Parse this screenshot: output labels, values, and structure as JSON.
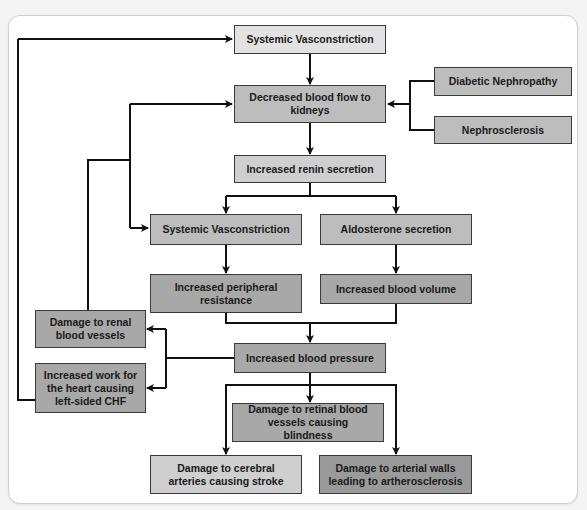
{
  "diagram": {
    "colors": {
      "panel_bg": "#ffffff",
      "box_light": "#e2e2e2",
      "box_mid": "#bdbdbd",
      "box_dark": "#a8a8a8",
      "arrow": "#111111"
    },
    "nodes": {
      "systemic_vasoconstriction_top": "Systemic Vasconstriction",
      "decreased_blood_flow": "Decreased blood flow to kidneys",
      "diabetic_nephropathy": "Diabetic Nephropathy",
      "nephrosclerosis": "Nephrosclerosis",
      "increased_renin": "Increased renin secretion",
      "systemic_vasoconstriction_mid": "Systemic Vasconstriction",
      "aldosterone": "Aldosterone secretion",
      "peripheral_resistance": "Increased peripheral resistance",
      "blood_volume": "Increased blood volume",
      "renal_vessel_damage": "Damage to renal blood vessels",
      "heart_work_chf": "Increased work for the heart causing left-sided CHF",
      "blood_pressure": "Increased blood pressure",
      "retinal_damage": "Damage to retinal blood vessels causing blindness",
      "cerebral_damage": "Damage to cerebral arteries causing stroke",
      "arterial_damage": "Damage to arterial walls leading to artherosclerosis"
    },
    "edges": [
      [
        "systemic_vasoconstriction_top",
        "decreased_blood_flow"
      ],
      [
        "diabetic_nephropathy",
        "decreased_blood_flow"
      ],
      [
        "nephrosclerosis",
        "decreased_blood_flow"
      ],
      [
        "decreased_blood_flow",
        "increased_renin"
      ],
      [
        "increased_renin",
        "systemic_vasoconstriction_mid"
      ],
      [
        "increased_renin",
        "aldosterone"
      ],
      [
        "systemic_vasoconstriction_mid",
        "peripheral_resistance"
      ],
      [
        "aldosterone",
        "blood_volume"
      ],
      [
        "peripheral_resistance",
        "blood_pressure"
      ],
      [
        "blood_volume",
        "blood_pressure"
      ],
      [
        "blood_pressure",
        "renal_vessel_damage"
      ],
      [
        "blood_pressure",
        "heart_work_chf"
      ],
      [
        "blood_pressure",
        "retinal_damage"
      ],
      [
        "blood_pressure",
        "cerebral_damage"
      ],
      [
        "blood_pressure",
        "arterial_damage"
      ],
      [
        "renal_vessel_damage",
        "decreased_blood_flow"
      ],
      [
        "renal_vessel_damage",
        "systemic_vasoconstriction_mid"
      ],
      [
        "heart_work_chf",
        "systemic_vasoconstriction_top"
      ]
    ]
  }
}
